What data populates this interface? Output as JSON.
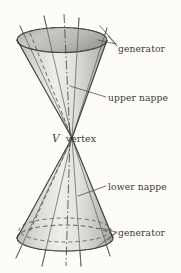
{
  "figure": {
    "kind": "double-cone-geometry-diagram",
    "background_color": "#fdfcf9",
    "stroke_color": "#4a4a48",
    "surface_fill_light": "#f2f1ef",
    "surface_fill_mid": "#c9c8c5",
    "surface_fill_dark": "#9a9996",
    "labels": {
      "generator_top": "generator",
      "upper_nappe": "upper nappe",
      "vertex_symbol": "V",
      "vertex_word": "vertex",
      "lower_nappe": "lower nappe",
      "generator_bottom": "generator"
    }
  }
}
